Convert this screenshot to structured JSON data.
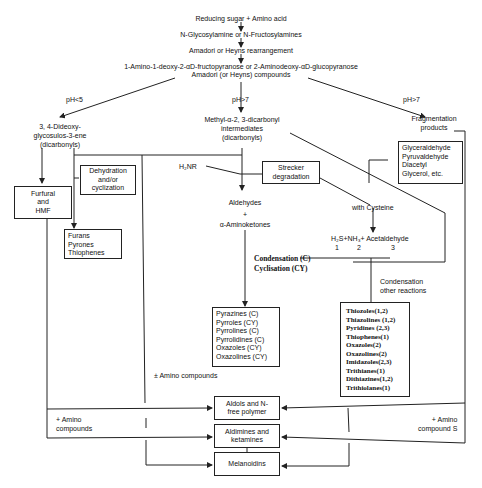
{
  "title_chain": {
    "step1": "Reducing sugar + Amino acid",
    "step2": "N-Glycosylamine or N-Fructosylamines",
    "step3": "Amadori or Heyns rearrangement",
    "step4_line1": "1-Amino-1-deoxy-2-αD-fructopyranose or 2-Aminodeoxy-αD-glucopyranose",
    "step4_line2": "Amadori (or Heyns) compounds"
  },
  "branches": {
    "left_label": "pH<5",
    "middle_label": "pH>7",
    "right_label": "pH>7"
  },
  "left_branch": {
    "product": [
      "3, 4-Dideoxy-",
      "glycosulos-3-ene",
      "(dicarbonyls)"
    ],
    "furfural_box": [
      "Furfural",
      "and",
      "HMF"
    ],
    "dehydration_box": [
      "Dehydration",
      "and/or",
      "cyclization"
    ],
    "furans_box": [
      "Furans",
      "Pyrones",
      "Thiophenes"
    ]
  },
  "middle_branch": {
    "product": [
      "Methyl-α-2, 3-dicarbonyl",
      "intermediates",
      "(dicarbonyls)"
    ],
    "h2nr": "H₂NR",
    "strecker_box": [
      "Strecker",
      "degradation"
    ],
    "aldehydes": "Aldehydes",
    "plus": "+",
    "aminoketones": "α-Aminoketones",
    "condensation": [
      "Condensation (C)",
      "Cyclisation (CY)"
    ],
    "heterocycles_box": [
      "Pyrazines (C)",
      "Pyrroles (CY)",
      "Pyrrolines (C)",
      "Pyrrolidines (C)",
      "Oxazoles (CY)",
      "Oxazolines (CY)"
    ],
    "amino_compounds": "± Amino compounds"
  },
  "right_branch": {
    "product": [
      "Fragmentation",
      "products"
    ],
    "fragments_box": [
      "Glyceraldehyde",
      "Pyruvaldehyde",
      "Diacetyl",
      "Glycerol, etc."
    ],
    "with_cysteine": "with Cysteine",
    "cysteine_products": "H₂S+NH₃+ Acetaldehyde",
    "cysteine_numbers": [
      "1",
      "2",
      "3"
    ],
    "condensation_other": [
      "Condensation",
      "other reactions"
    ],
    "sulfur_box": [
      "Thiozoles(1,2)",
      "Thiazolines (1,2)",
      "Pyridines (2,3)",
      "Thiophenes(1)",
      "Oxazoles(2)",
      "Oxazolines(2)",
      "Imidazoles(2,3)",
      "Trithianes(1)",
      "Dithiazines(1,2)",
      "Trithiolanes(1)"
    ]
  },
  "bottom": {
    "left_amino": [
      "+ Amino",
      "compounds"
    ],
    "right_amino": [
      "+ Amino",
      "compound S"
    ],
    "aldols_box": [
      "Aldols and N-",
      "free polymer"
    ],
    "aldimines_box": [
      "Aldimines and",
      "ketamines"
    ],
    "melanoidins_box": [
      "Melanoidins"
    ]
  },
  "colors": {
    "line": "#222222",
    "background": "#ffffff"
  }
}
